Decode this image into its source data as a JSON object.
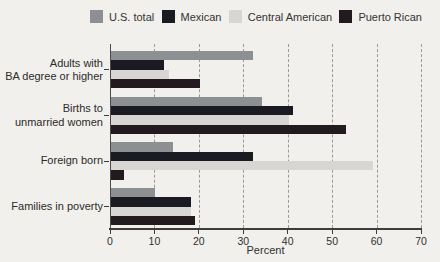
{
  "figure": {
    "title_cropped": "Selected characteristics of the Hispanic population by origin"
  },
  "chart_data": {
    "type": "bar",
    "orientation": "horizontal",
    "title": "",
    "xlabel": "Percent",
    "xlim": [
      0,
      70
    ],
    "xticks": [
      0,
      10,
      20,
      30,
      40,
      50,
      60,
      70
    ],
    "grid": "vertical-dashed",
    "legend_position": "top",
    "categories": [
      "Adults with\nBA degree or higher",
      "Births to\nunmarried women",
      "Foreign born",
      "Families in poverty"
    ],
    "series": [
      {
        "name": "U.S. total",
        "color": "#8d9093",
        "values": [
          32,
          34,
          14,
          10
        ]
      },
      {
        "name": "Mexican",
        "color": "#1a1a23",
        "values": [
          12,
          41,
          32,
          18
        ]
      },
      {
        "name": "Central American",
        "color": "#d7d6d2",
        "values": [
          13,
          40,
          59,
          18
        ]
      },
      {
        "name": "Puerto Rican",
        "color": "#221a1e",
        "values": [
          20,
          53,
          3,
          19
        ]
      }
    ],
    "colors": {
      "background": "#f2f0ec",
      "gridline": "#9d9a94",
      "axis": "#3c3c3c",
      "text": "#2f2f2f"
    }
  }
}
